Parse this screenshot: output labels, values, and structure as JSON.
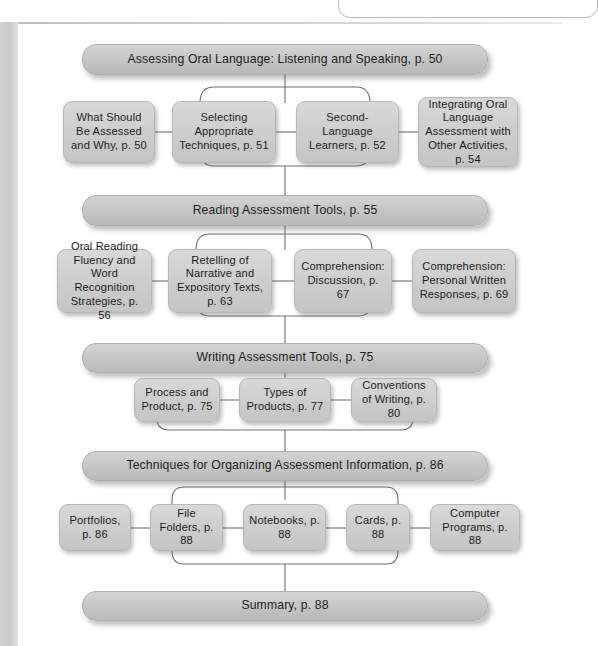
{
  "figure": {
    "type": "flowchart"
  },
  "sections": [
    {
      "id": "oral-language",
      "header": "Assessing Oral Language: Listening and Speaking, p. 50",
      "nodes": [
        "What Should Be Assessed and Why, p. 50",
        "Selecting Appropriate Techniques, p. 51",
        "Second-Language Learners, p. 52",
        "Integrating Oral Language Assessment with Other Activities, p. 54"
      ]
    },
    {
      "id": "reading",
      "header": "Reading Assessment Tools, p. 55",
      "nodes": [
        "Oral Reading Fluency and Word Recognition Strategies, p. 56",
        "Retelling of Narrative and Expository Texts, p. 63",
        "Comprehension: Discussion, p. 67",
        "Comprehension: Personal Written Responses, p. 69"
      ]
    },
    {
      "id": "writing",
      "header": "Writing Assessment Tools, p. 75",
      "nodes": [
        "Process and Product, p. 75",
        "Types of Products, p. 77",
        "Conventions of Writing, p. 80"
      ]
    },
    {
      "id": "organizing",
      "header": "Techniques for Organizing Assessment Information, p. 86",
      "nodes": [
        "Portfolios, p. 86",
        "File Folders, p. 88",
        "Notebooks, p. 88",
        "Cards, p. 88",
        "Computer Programs, p. 88"
      ]
    },
    {
      "id": "summary",
      "header": "Summary, p. 88",
      "nodes": []
    }
  ],
  "colors": {
    "box_fill_top": "#d9d9d9",
    "box_fill_bottom": "#c4c4c4",
    "bar_fill_top": "#d4d4d4",
    "bar_fill_bottom": "#b9b9b9",
    "stroke": "#6e6e6e",
    "text": "#1b1b1b",
    "page_background": "#ffffff",
    "left_strip": "#cdcdcd"
  }
}
